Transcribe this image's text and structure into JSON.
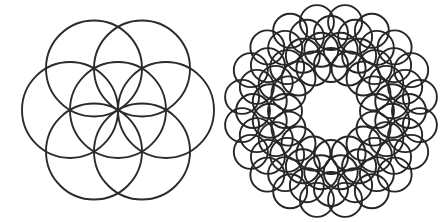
{
  "page": {
    "width": 444,
    "height": 222,
    "background_color": "#ffffff"
  },
  "figures": [
    {
      "name": "seed-of-life-pattern",
      "label": "Seed of Life",
      "position": "left",
      "center": {
        "x": 118,
        "y": 110
      },
      "stroke_color": "#2b2b2b",
      "stroke_width": 1.9,
      "circle_radius": 48,
      "ring_count": 1,
      "circle_count": 7,
      "rings": [
        {
          "name": "center-circle",
          "radial_distance": 0,
          "count": 1,
          "radius": 48,
          "angle_offset_deg": 0
        },
        {
          "name": "petal-ring",
          "radial_distance": 48,
          "count": 6,
          "radius": 48,
          "angle_offset_deg": 30
        }
      ],
      "bounds": {
        "x_min": 26,
        "y_min": 14,
        "x_max": 212,
        "y_max": 208
      }
    },
    {
      "name": "radial-mandala-pattern",
      "label": "Radial Mandala",
      "position": "right",
      "center": {
        "x": 331,
        "y": 111
      },
      "stroke_color": "#262626",
      "stroke_width": 1.9,
      "circle_radius": 17,
      "ring_count": 4,
      "circle_count": 76,
      "rings": [
        {
          "name": "ring-1-inner",
          "radial_distance": 46,
          "count": 16,
          "radius": 17,
          "angle_offset_deg": 0
        },
        {
          "name": "ring-2",
          "radial_distance": 62,
          "count": 20,
          "radius": 17,
          "angle_offset_deg": 9
        },
        {
          "name": "ring-3",
          "radial_distance": 78,
          "count": 20,
          "radius": 17,
          "angle_offset_deg": 0
        },
        {
          "name": "ring-4-outer",
          "radial_distance": 90,
          "count": 20,
          "radius": 17,
          "angle_offset_deg": 9
        }
      ],
      "bounds": {
        "x_min": 227,
        "y_min": 11,
        "x_max": 436,
        "y_max": 212
      }
    }
  ]
}
